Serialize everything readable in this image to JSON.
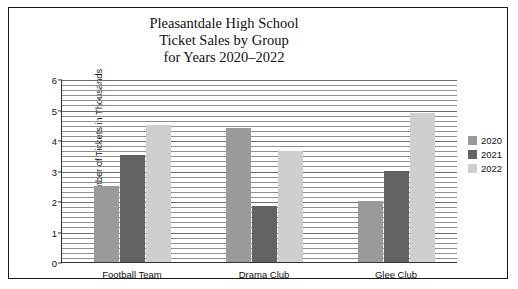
{
  "chart_data": {
    "type": "bar",
    "title": "Pleasantdale High School Ticket Sales by Group for Years 2020–2022",
    "title_lines": [
      "Pleasantdale High School",
      "Ticket Sales by Group",
      "for Years 2020–2022"
    ],
    "xlabel": "",
    "ylabel": "Number of Tickets in Thousands",
    "ylim": [
      0,
      6
    ],
    "yticks": [
      0,
      1,
      2,
      3,
      4,
      5,
      6
    ],
    "ytick_labels": [
      "0",
      "1",
      "2",
      "3",
      "4",
      "5",
      "6"
    ],
    "grid": true,
    "grid_orientation": "horizontal",
    "legend_position": "right",
    "categories": [
      "Football Team",
      "Drama Club",
      "Glee Club"
    ],
    "series": [
      {
        "name": "2020",
        "color": "#9a9a9a",
        "values": [
          2.5,
          4.4,
          2.0
        ]
      },
      {
        "name": "2021",
        "color": "#636363",
        "values": [
          3.5,
          1.85,
          3.0
        ]
      },
      {
        "name": "2022",
        "color": "#cfcfcf",
        "values": [
          4.5,
          3.65,
          4.9
        ]
      }
    ]
  }
}
